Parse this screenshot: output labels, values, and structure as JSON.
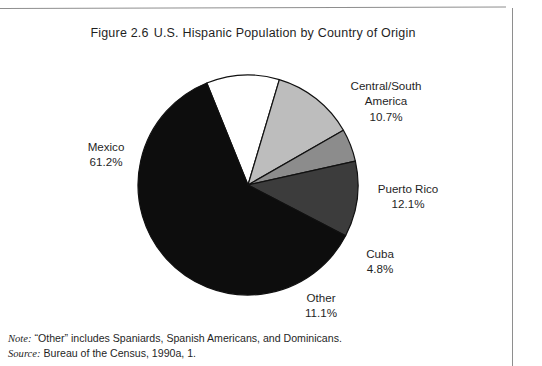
{
  "figure": {
    "number": "Figure 2.6",
    "title": "U.S. Hispanic Population by Country of Origin"
  },
  "footnotes": [
    {
      "key": "Note:",
      "text": "“Other” includes Spaniards, Spanish Americans, and Dominicans."
    },
    {
      "key": "Source:",
      "text": "Bureau of the Census, 1990a, 1."
    }
  ],
  "chart_data": {
    "type": "pie",
    "title": "U.S. Hispanic Population by Country of Origin",
    "xlabel": "",
    "ylabel": "",
    "units": "percent",
    "legend_position": "none",
    "grid": false,
    "start_angle_deg": -22,
    "direction": "clockwise",
    "categories": [
      "Central/South America",
      "Puerto Rico",
      "Cuba",
      "Other",
      "Mexico"
    ],
    "values": [
      10.7,
      12.1,
      4.8,
      11.1,
      61.2
    ],
    "slices": [
      {
        "label": "Central/South America",
        "label_line1": "Central/South",
        "label_line2": "America",
        "value": 10.7,
        "value_text": "10.7%",
        "color": "#ffffff",
        "stroke": "#111111"
      },
      {
        "label": "Puerto Rico",
        "label_line1": "Puerto Rico",
        "label_line2": "",
        "value": 12.1,
        "value_text": "12.1%",
        "color": "#bdbdbd",
        "stroke": "#111111"
      },
      {
        "label": "Cuba",
        "label_line1": "Cuba",
        "label_line2": "",
        "value": 4.8,
        "value_text": "4.8%",
        "color": "#8c8c8c",
        "stroke": "#111111"
      },
      {
        "label": "Other",
        "label_line1": "Other",
        "label_line2": "",
        "value": 11.1,
        "value_text": "11.1%",
        "color": "#3c3c3c",
        "stroke": "#111111"
      },
      {
        "label": "Mexico",
        "label_line1": "Mexico",
        "label_line2": "",
        "value": 61.2,
        "value_text": "61.2%",
        "color": "#0d0d0d",
        "stroke": "#111111"
      }
    ],
    "geometry": {
      "cx": 248,
      "cy": 185,
      "r": 110
    }
  },
  "colors": {
    "page_background": "#ffffff",
    "text": "#1f1f1f",
    "rule": "#8e8e8e"
  }
}
